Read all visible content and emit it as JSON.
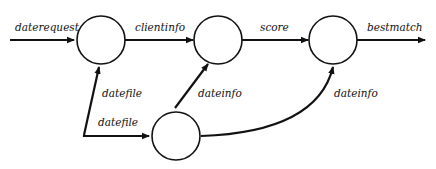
{
  "diagram": {
    "type": "data-flow",
    "nodes": [
      {
        "id": "n1",
        "label": ""
      },
      {
        "id": "n2",
        "label": ""
      },
      {
        "id": "n3",
        "label": ""
      },
      {
        "id": "n4",
        "label": ""
      }
    ],
    "edges": [
      {
        "id": "e1",
        "from": "external",
        "to": "n1",
        "label": "daterequest"
      },
      {
        "id": "e2",
        "from": "n1",
        "to": "n2",
        "label": "clientinfo"
      },
      {
        "id": "e3",
        "from": "n2",
        "to": "n3",
        "label": "score"
      },
      {
        "id": "e4",
        "from": "n3",
        "to": "external",
        "label": "bestmatch"
      },
      {
        "id": "e5",
        "from": "external",
        "to": "n1",
        "label": "datefile"
      },
      {
        "id": "e6",
        "from": "external",
        "to": "n4",
        "label": "datefile"
      },
      {
        "id": "e7",
        "from": "n4",
        "to": "n2",
        "label": "dateinfo"
      },
      {
        "id": "e8",
        "from": "n4",
        "to": "n3",
        "label": "dateinfo"
      }
    ]
  }
}
